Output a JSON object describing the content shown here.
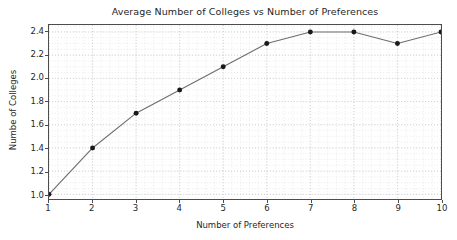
{
  "chart_data": {
    "type": "line",
    "title": "Average Number of Colleges vs Number of Preferences",
    "xlabel": "Number of Preferences",
    "ylabel": "Numbe of Colleges",
    "x": [
      1,
      2,
      3,
      4,
      5,
      6,
      7,
      8,
      9,
      10
    ],
    "values": [
      1.0,
      1.4,
      1.7,
      1.9,
      2.1,
      2.3,
      2.4,
      2.4,
      2.3,
      2.4
    ],
    "series": [
      {
        "name": "Average Number of Colleges",
        "values": [
          1.0,
          1.4,
          1.7,
          1.9,
          2.1,
          2.3,
          2.4,
          2.4,
          2.3,
          2.4
        ]
      }
    ],
    "xlim": [
      1,
      10
    ],
    "ylim": [
      0.96,
      2.46
    ],
    "xticks": [
      1,
      2,
      3,
      4,
      5,
      6,
      7,
      8,
      9,
      10
    ],
    "xticklabels": [
      "1",
      "2",
      "3",
      "4",
      "5",
      "6",
      "7",
      "8",
      "9",
      "10"
    ],
    "yticks": [
      1.0,
      1.2,
      1.4,
      1.6,
      1.8,
      2.0,
      2.2,
      2.4
    ],
    "yticklabels": [
      "1.0",
      "1.2",
      "1.4",
      "1.6",
      "1.8",
      "2.0",
      "2.2",
      "2.4"
    ],
    "grid": true,
    "grid_minor": true,
    "legend": null,
    "legend_position": "none",
    "marker": "circle",
    "colors": {
      "line": "#6e6e6e",
      "marker": "#1a1a1a",
      "grid": "#cccccc",
      "grid_minor": "#dedede",
      "axis": "#4d4d4d",
      "text": "#262626",
      "background": "#ffffff"
    }
  }
}
